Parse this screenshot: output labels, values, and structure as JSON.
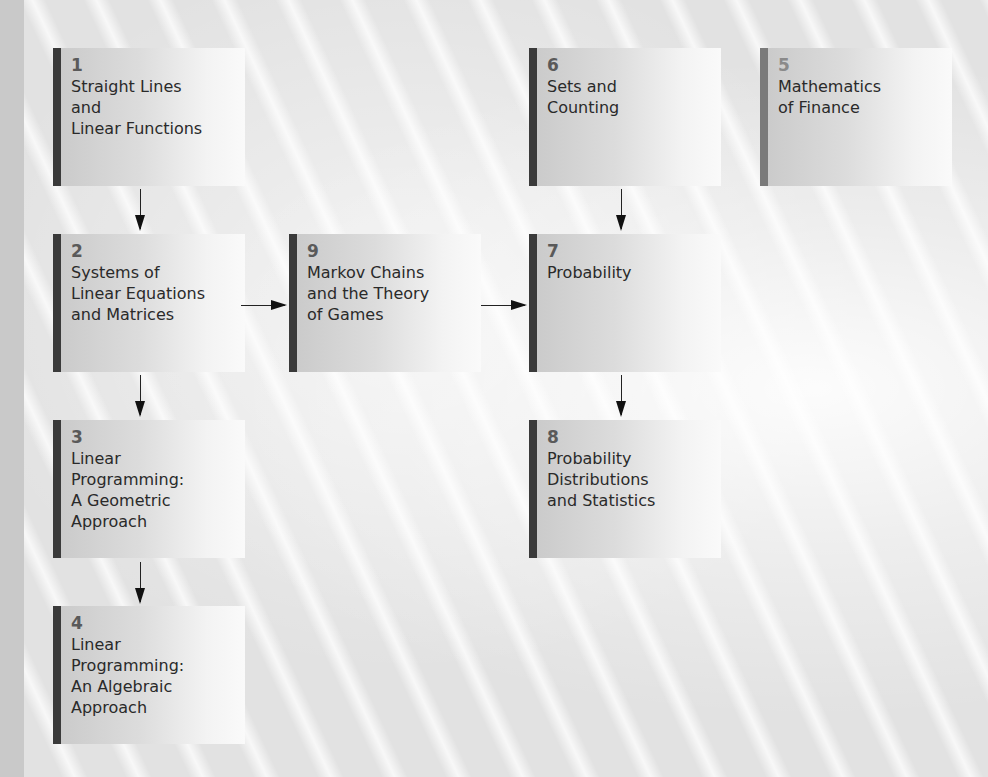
{
  "diagram": {
    "type": "chapter-dependency-flowchart",
    "nodes": [
      {
        "id": "1",
        "number": "1",
        "title": "Straight Lines\nand\nLinear Functions"
      },
      {
        "id": "2",
        "number": "2",
        "title": "Systems of\nLinear Equations\nand Matrices"
      },
      {
        "id": "3",
        "number": "3",
        "title": "Linear\nProgramming:\nA Geometric\nApproach"
      },
      {
        "id": "4",
        "number": "4",
        "title": "Linear\nProgramming:\nAn Algebraic\nApproach"
      },
      {
        "id": "5",
        "number": "5",
        "title": "Mathematics\nof Finance"
      },
      {
        "id": "6",
        "number": "6",
        "title": "Sets and\nCounting"
      },
      {
        "id": "7",
        "number": "7",
        "title": "Probability"
      },
      {
        "id": "8",
        "number": "8",
        "title": "Probability\nDistributions\nand Statistics"
      },
      {
        "id": "9",
        "number": "9",
        "title": "Markov Chains\nand the Theory\nof Games"
      }
    ],
    "edges": [
      {
        "from": "1",
        "to": "2"
      },
      {
        "from": "2",
        "to": "3"
      },
      {
        "from": "3",
        "to": "4"
      },
      {
        "from": "2",
        "to": "9"
      },
      {
        "from": "9",
        "to": "7"
      },
      {
        "from": "6",
        "to": "7"
      },
      {
        "from": "7",
        "to": "8"
      }
    ]
  },
  "colors": {
    "bar_dark": "#3a3a3a",
    "bar_light": "#7a7a7a",
    "background": "#e2e2e2"
  }
}
